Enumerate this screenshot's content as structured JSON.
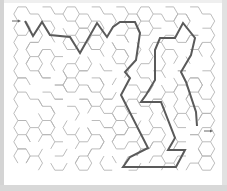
{
  "maze": {
    "type": "hexagonal maze",
    "wall_color": "#b4b4b4",
    "solution_color": "#5a5a5a",
    "background": "#ffffff",
    "start_arrow": {
      "x": 14,
      "y": 21,
      "direction": "right",
      "label": "→"
    },
    "end_arrow": {
      "x": 208,
      "y": 131,
      "direction": "right",
      "label": "→"
    },
    "solution_path": [
      [
        25,
        21
      ],
      [
        33,
        36
      ],
      [
        42,
        22
      ],
      [
        50,
        35
      ],
      [
        70,
        37
      ],
      [
        80,
        53
      ],
      [
        97,
        23
      ],
      [
        107,
        37
      ],
      [
        113,
        27
      ],
      [
        120,
        22
      ],
      [
        135,
        22
      ],
      [
        140,
        33
      ],
      [
        136,
        60
      ],
      [
        125,
        72
      ],
      [
        130,
        78
      ],
      [
        121,
        95
      ],
      [
        148,
        148
      ],
      [
        130,
        157
      ],
      [
        123,
        167
      ],
      [
        176,
        167
      ],
      [
        185,
        150
      ],
      [
        168,
        150
      ],
      [
        175,
        138
      ],
      [
        161,
        102
      ],
      [
        141,
        102
      ],
      [
        146,
        95
      ],
      [
        155,
        80
      ],
      [
        155,
        50
      ],
      [
        160,
        38
      ],
      [
        175,
        38
      ],
      [
        183,
        23
      ],
      [
        195,
        38
      ],
      [
        191,
        55
      ],
      [
        181,
        72
      ],
      [
        186,
        82
      ],
      [
        196,
        112
      ],
      [
        197,
        126
      ]
    ]
  }
}
